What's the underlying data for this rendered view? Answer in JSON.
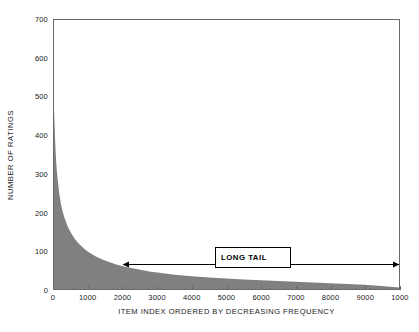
{
  "chart_data": {
    "type": "area",
    "title": "",
    "subtitle": "",
    "xlabel": "ITEM INDEX ORDERED BY DECREASING FREQUENCY",
    "ylabel": "NUMBER OF RATINGS",
    "xlim": [
      0,
      10000
    ],
    "ylim": [
      0,
      700
    ],
    "xticks": [
      0,
      1000,
      2000,
      3000,
      4000,
      5000,
      6000,
      7000,
      8000,
      9000,
      10000
    ],
    "xticklabels": [
      "0",
      "1000",
      "2000",
      "3000",
      "4000",
      "5000",
      "6000",
      "7000",
      "8000",
      "9000",
      "1000"
    ],
    "yticks": [
      0,
      100,
      200,
      300,
      400,
      500,
      600,
      700
    ],
    "yticklabels": [
      "0",
      "100",
      "200",
      "300",
      "400",
      "500",
      "600",
      "700"
    ],
    "grid": false,
    "legend": null,
    "series": [
      {
        "name": "ratings per item",
        "fill_color": "#808080",
        "x": [
          0,
          20,
          40,
          60,
          80,
          100,
          150,
          200,
          250,
          300,
          400,
          500,
          600,
          700,
          800,
          900,
          1000,
          1200,
          1400,
          1600,
          1800,
          2000,
          2200,
          2500,
          2800,
          3000,
          3500,
          4000,
          4500,
          5000,
          5500,
          6000,
          6500,
          7000,
          7500,
          8000,
          8500,
          9000,
          9500,
          10000
        ],
        "y": [
          470,
          420,
          370,
          335,
          310,
          290,
          250,
          222,
          202,
          186,
          162,
          145,
          131,
          120,
          111,
          103,
          96,
          85,
          77,
          70,
          64,
          59,
          55,
          50,
          45,
          43,
          37,
          33,
          30,
          27,
          25,
          23,
          21,
          19,
          17,
          15,
          13,
          11,
          8,
          4
        ]
      }
    ],
    "annotations": [
      {
        "name": "long-tail",
        "label": "LONG TAIL",
        "type": "double-arrow-with-box",
        "arrow_x_start": 2100,
        "arrow_x_end": 10000,
        "arrow_y": 50,
        "box_x": 4650,
        "box_y": 95
      }
    ],
    "colors": {
      "fill": "#808080",
      "axis": "#6b6b6b",
      "text": "#1a1a1a",
      "annotation": "#000000",
      "background": "#ffffff"
    }
  }
}
